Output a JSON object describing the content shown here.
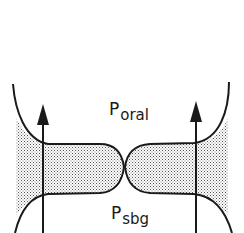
{
  "diagram": {
    "labels": {
      "oral": {
        "main": "P",
        "sub": "oral"
      },
      "sbg": {
        "main": "P",
        "sub": "sbg"
      }
    },
    "colors": {
      "stroke": "#1a1a1a",
      "shading": "#9a9a9a",
      "background": "#ffffff"
    },
    "elements": [
      "left-vocal-fold",
      "right-vocal-fold",
      "left-airflow-arrow",
      "right-airflow-arrow",
      "contact-point"
    ]
  }
}
